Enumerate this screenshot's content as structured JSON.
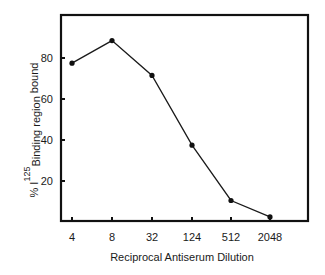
{
  "chart_data": {
    "type": "line",
    "title": "",
    "xlabel": "Reciprocal Antiserum Dilution",
    "ylabel": {
      "prefix": "% I",
      "superscript": "125",
      "subscript": "Binding region",
      "suffix": " bound",
      "full": "% I125 Binding region bound"
    },
    "categories": [
      "4",
      "8",
      "32",
      "124",
      "512",
      "2048"
    ],
    "values": [
      77.5,
      88.5,
      71.5,
      37.5,
      10.5,
      2.5
    ],
    "yticks": [
      20,
      40,
      60,
      80
    ],
    "ylim": [
      0,
      107
    ],
    "grid": false,
    "legend": null,
    "colors": {
      "line": "#1a1a1a",
      "frame": "#111111"
    }
  }
}
